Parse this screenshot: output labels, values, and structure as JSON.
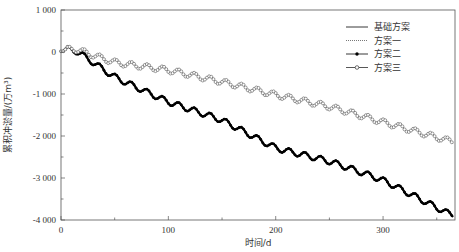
{
  "chart_data": {
    "type": "line",
    "title": "",
    "xlabel": "时间/d",
    "ylabel": "累积冲淤量/(万m³)",
    "xlim": [
      0,
      367
    ],
    "ylim": [
      -4000,
      1000
    ],
    "xticks": [
      0,
      100,
      200,
      300
    ],
    "xtick_labels": [
      "0",
      "100",
      "200",
      "300"
    ],
    "yticks": [
      1000,
      0,
      -1000,
      -2000,
      -3000,
      -4000
    ],
    "ytick_labels": [
      "1 000",
      "0",
      "-1 000",
      "-2 000",
      "-3 000",
      "-4 000"
    ],
    "grid": false,
    "legend_position": "upper right",
    "oscillation": {
      "period_days": 14.7,
      "amplitude": 70
    },
    "series": [
      {
        "name": "基础方案",
        "style": "solid",
        "color": "#000000",
        "x": [
          0,
          10,
          50,
          100,
          150,
          200,
          250,
          300,
          365
        ],
        "values": [
          0,
          100,
          -600,
          -1190,
          -1620,
          -2290,
          -2600,
          -3050,
          -3900
        ]
      },
      {
        "name": "方案一",
        "style": "dotted",
        "color": "#555555",
        "x": [
          0,
          10,
          50,
          100,
          150,
          200,
          250,
          300,
          365
        ],
        "values": [
          0,
          100,
          -250,
          -430,
          -710,
          -1020,
          -1300,
          -1670,
          -2140
        ]
      },
      {
        "name": "方案二",
        "style": "solid-filled-dot",
        "color": "#000000",
        "x": [
          0,
          10,
          50,
          100,
          150,
          200,
          250,
          300,
          365
        ],
        "values": [
          0,
          100,
          -600,
          -1190,
          -1620,
          -2290,
          -2600,
          -3050,
          -3900
        ]
      },
      {
        "name": "方案三",
        "style": "solid-hollow-circle",
        "color": "#444444",
        "x": [
          0,
          10,
          50,
          100,
          150,
          200,
          250,
          300,
          365
        ],
        "values": [
          0,
          100,
          -250,
          -430,
          -710,
          -1020,
          -1300,
          -1670,
          -2140
        ]
      }
    ]
  },
  "legend": {
    "items": [
      {
        "label": "基础方案",
        "style": "solid"
      },
      {
        "label": "方案一",
        "style": "dotted"
      },
      {
        "label": "方案二",
        "style": "filled-dot"
      },
      {
        "label": "方案三",
        "style": "hollow-circle"
      }
    ]
  },
  "axes": {
    "xlabel": "时间/d",
    "ylabel": "累积冲淤量/(万m³)"
  }
}
